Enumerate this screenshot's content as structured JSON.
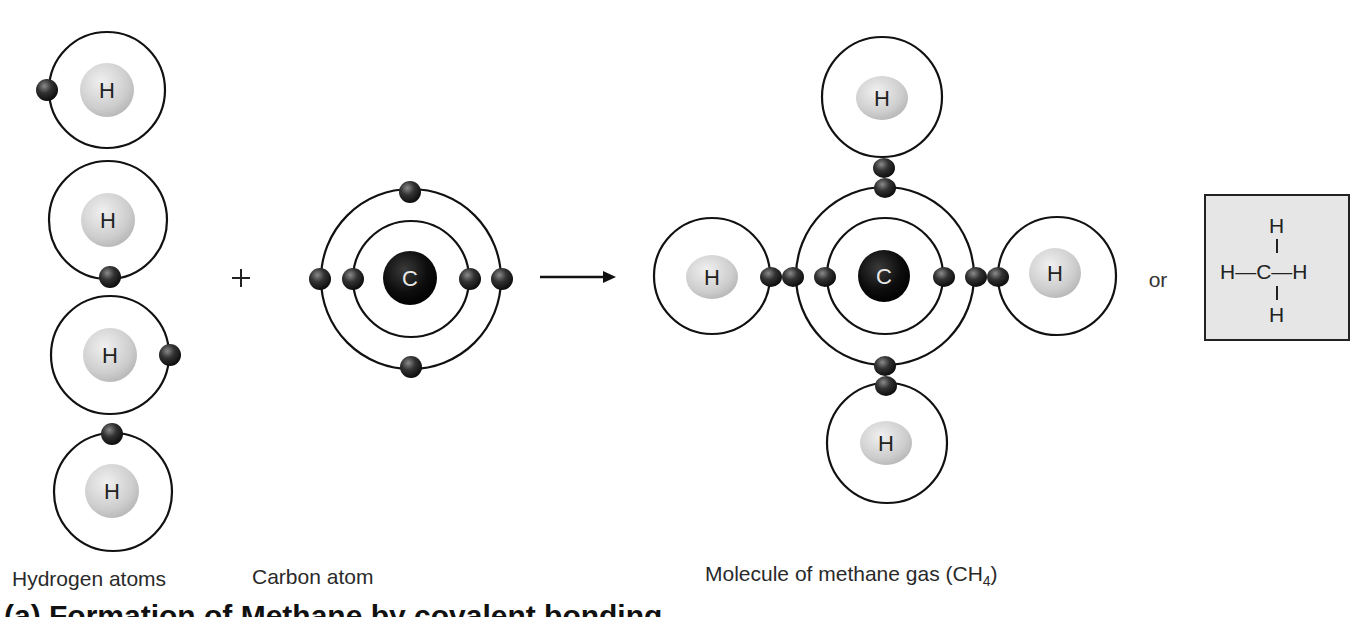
{
  "labels": {
    "hydrogen_atoms": "Hydrogen atoms",
    "carbon_atom": "Carbon atom",
    "methane_prefix": "Molecule of methane gas (CH",
    "methane_sub": "4",
    "methane_suffix": ")",
    "plus": "+",
    "or": "or",
    "cutoff_caption": "(a) Formation of Methane by covalent bonding"
  },
  "atoms": {
    "hydrogen_symbol": "H",
    "carbon_symbol": "C"
  },
  "structural_formula": {
    "top": "H",
    "middle": "H—C—H",
    "bottom": "H"
  },
  "colors": {
    "background": "#ffffff",
    "electron": "#2b2b2b",
    "hydrogen_nucleus": "#cfcfcf",
    "carbon_nucleus": "#0d0d0d",
    "formula_box": "#e6e6e6",
    "orbit": "#111111"
  }
}
